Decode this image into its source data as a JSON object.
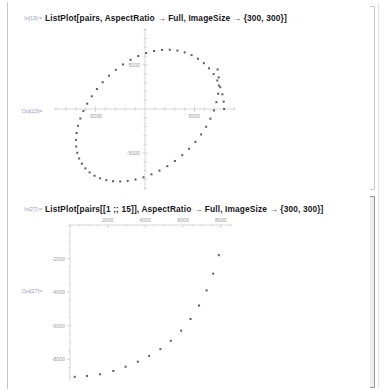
{
  "app": {
    "name": "Mathematica Notebook"
  },
  "cells": [
    {
      "kind": "input",
      "label": "In[13]:=",
      "code": "ListPlot[pairs, AspectRatio → Full, ImageSize → {300, 300}]"
    },
    {
      "kind": "output",
      "label": "Out[13]="
    },
    {
      "kind": "input",
      "label": "In[27]:=",
      "code": "ListPlot[pairs[[1 ;; 15]], AspectRatio → Full, ImageSize → {300, 300}]"
    },
    {
      "kind": "output",
      "label": "Out[27]="
    }
  ],
  "chart_data": [
    {
      "type": "scatter",
      "title": "",
      "xlabel": "",
      "ylabel": "",
      "xlim": [
        -9200,
        9200
      ],
      "ylim": [
        -9200,
        9200
      ],
      "grid": false,
      "legend": null,
      "axes_position": "origin-cross",
      "xticks": [
        -5000,
        5000
      ],
      "xticklabels": [
        "-5000",
        "5000"
      ],
      "yticks": [
        5000,
        -5000
      ],
      "yticklabels": [
        "5000",
        "-5000"
      ],
      "minor_tick_step": 1000,
      "description": "60 points evenly spaced on a circle of radius 8000 centered at the origin",
      "points": [
        [
          8000,
          0
        ],
        [
          7956,
          837
        ],
        [
          7825,
          1667
        ],
        [
          7608,
          2472
        ],
        [
          7308,
          3242
        ],
        [
          6928,
          3961
        ],
        [
          6472,
          4619
        ],
        [
          5946,
          5204
        ],
        [
          5355,
          5706
        ],
        [
          4708,
          6116
        ],
        [
          4011,
          6427
        ],
        [
          3275,
          6632
        ],
        [
          2507,
          6729
        ],
        [
          1718,
          6714
        ],
        [
          918,
          6589
        ],
        [
          115,
          6355
        ],
        [
          -682,
          6018
        ],
        [
          -1463,
          5583
        ],
        [
          -2222,
          5058
        ],
        [
          -2948,
          4453
        ],
        [
          -3635,
          3777
        ],
        [
          -4275,
          3042
        ],
        [
          -4860,
          2261
        ],
        [
          -5385,
          1445
        ],
        [
          -5843,
          609
        ],
        [
          -6229,
          -234
        ],
        [
          -6539,
          -1077
        ],
        [
          -6769,
          -1910
        ],
        [
          -6916,
          -2724
        ],
        [
          -6979,
          -3510
        ],
        [
          -6957,
          -4261
        ],
        [
          -6849,
          -4967
        ],
        [
          -6658,
          -5621
        ],
        [
          -6384,
          -6215
        ],
        [
          -6031,
          -6743
        ],
        [
          -5602,
          -7199
        ],
        [
          -5102,
          -7577
        ],
        [
          -4536,
          -7873
        ],
        [
          -3910,
          -8082
        ],
        [
          -3232,
          -8202
        ],
        [
          -2508,
          -8230
        ],
        [
          -1748,
          -8166
        ],
        [
          -961,
          -8009
        ],
        [
          -157,
          -7761
        ],
        [
          654,
          -7422
        ],
        [
          1462,
          -6997
        ],
        [
          2256,
          -6488
        ],
        [
          3027,
          -5901
        ],
        [
          3763,
          -5241
        ],
        [
          4456,
          -4515
        ],
        [
          5095,
          -3730
        ],
        [
          5673,
          -2894
        ],
        [
          6181,
          -2016
        ],
        [
          6613,
          -1105
        ],
        [
          6962,
          -171
        ],
        [
          7224,
          776
        ],
        [
          7395,
          1726
        ],
        [
          7472,
          2668
        ],
        [
          7453,
          3593
        ],
        [
          7338,
          4490
        ]
      ]
    },
    {
      "type": "scatter",
      "title": "",
      "xlabel": "",
      "ylabel": "",
      "xlim": [
        0,
        8600
      ],
      "ylim": [
        -9300,
        0
      ],
      "grid": false,
      "legend": null,
      "axes_position": "top-left",
      "xticks": [
        2000,
        4000,
        6000,
        8000
      ],
      "xticklabels": [
        "2000",
        "4000",
        "6000",
        "8000"
      ],
      "yticks": [
        -2000,
        -4000,
        -6000,
        -8000
      ],
      "yticklabels": [
        "-2000",
        "-4000",
        "-6000",
        "-8000"
      ],
      "minor_tick_step": 500,
      "description": "First 15 points of pairs; a rising curve from lower-left to upper-right",
      "points": [
        [
          250,
          -9050
        ],
        [
          900,
          -9000
        ],
        [
          1600,
          -8900
        ],
        [
          2300,
          -8700
        ],
        [
          2950,
          -8450
        ],
        [
          3600,
          -8150
        ],
        [
          4200,
          -7800
        ],
        [
          4800,
          -7400
        ],
        [
          5350,
          -6900
        ],
        [
          5900,
          -6300
        ],
        [
          6400,
          -5600
        ],
        [
          6850,
          -4800
        ],
        [
          7250,
          -3900
        ],
        [
          7600,
          -2900
        ],
        [
          7900,
          -1800
        ]
      ]
    }
  ]
}
